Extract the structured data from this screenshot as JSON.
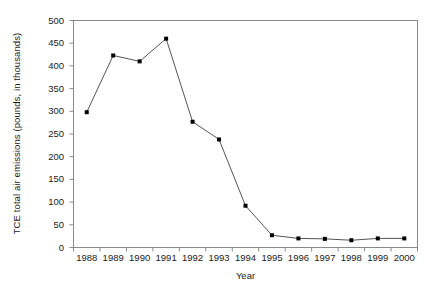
{
  "chart_data": {
    "type": "line",
    "title": "",
    "xlabel": "Year",
    "ylabel": "TCE total air emissions (pounds, in thousands)",
    "categories": [
      "1988",
      "1989",
      "1990",
      "1991",
      "1992",
      "1993",
      "1994",
      "1995",
      "1996",
      "1997",
      "1998",
      "1999",
      "2000"
    ],
    "x": [
      1988,
      1989,
      1990,
      1991,
      1992,
      1993,
      1994,
      1995,
      1996,
      1997,
      1998,
      1999,
      2000
    ],
    "values": [
      298,
      423,
      410,
      460,
      277,
      238,
      92,
      27,
      20,
      19,
      16,
      20,
      20
    ],
    "series": [
      {
        "name": "TCE total air emissions",
        "values": [
          298,
          423,
          410,
          460,
          277,
          238,
          92,
          27,
          20,
          19,
          16,
          20,
          20
        ]
      }
    ],
    "ylim": [
      0,
      500
    ],
    "yticks": [
      0,
      50,
      100,
      150,
      200,
      250,
      300,
      350,
      400,
      450,
      500
    ],
    "ytick_labels": [
      "0",
      "50",
      "100",
      "150",
      "200",
      "250",
      "300",
      "350",
      "400",
      "450",
      "500"
    ],
    "xtick_labels": [
      "1988",
      "1989",
      "1990",
      "1991",
      "1992",
      "1993",
      "1994",
      "1995",
      "1996",
      "1997",
      "1998",
      "1999",
      "2000"
    ],
    "grid": false,
    "legend": false,
    "legend_position": "none",
    "marker": "filled-square",
    "line_color": "#555555",
    "marker_color": "#000000",
    "axis_color": "#808080",
    "background_color": "#ffffff"
  },
  "axes": {
    "y_title": "TCE total air emissions (pounds, in thousands)",
    "x_title": "Year"
  }
}
